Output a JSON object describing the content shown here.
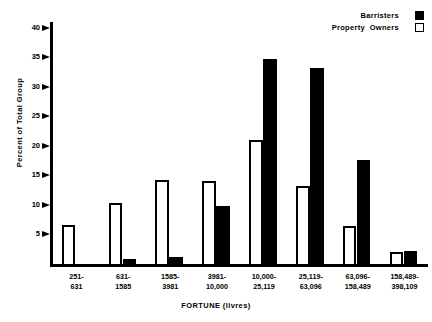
{
  "chart_data": {
    "type": "bar",
    "title": "",
    "xlabel": "FORTUNE  (livres)",
    "ylabel": "Percent of Total Group",
    "ylim": [
      0,
      41
    ],
    "yticks": [
      5,
      10,
      15,
      20,
      25,
      30,
      35,
      40
    ],
    "grid": false,
    "legend_position": "top-right",
    "categories": [
      "251-\n631",
      "631-\n1585",
      "1585-\n3981",
      "3981-\n10,000",
      "10,000-\n25,119",
      "25,119-\n63,096",
      "63,096-\n158,489",
      "158,489-\n398,109"
    ],
    "series": [
      {
        "name": "Barristers",
        "color": "#000000",
        "fill": "solid",
        "values": [
          0,
          0.8,
          1.2,
          9.8,
          34.8,
          33.2,
          17.7,
          2.2
        ]
      },
      {
        "name": "Property Owners",
        "color": "#FFFFFF",
        "fill": "outline",
        "values": [
          6.6,
          10.4,
          14.2,
          14.0,
          21.0,
          13.2,
          6.4,
          2.0
        ]
      }
    ]
  },
  "legend": {
    "items": [
      {
        "label": "Barristers",
        "swatch": "filled-square-icon"
      },
      {
        "label": "Property  Owners",
        "swatch": "outlined-square-icon"
      }
    ]
  }
}
